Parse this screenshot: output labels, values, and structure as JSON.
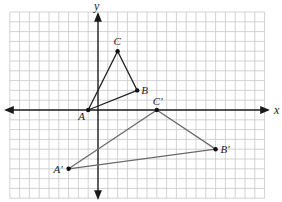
{
  "diagram": {
    "type": "coordinate-plane-transformation",
    "origin_px": [
      98,
      110
    ],
    "unit_px": 9.8,
    "grid": {
      "x_min": -9,
      "x_max": 17,
      "y_min": -9,
      "y_max": 10,
      "color": "#c8c8c8"
    },
    "axes": {
      "x_label": "x",
      "y_label": "y",
      "color": "#1a1a1a"
    },
    "triangle_original": {
      "color": "#222222",
      "points": [
        {
          "label": "A",
          "x": -1,
          "y": 0
        },
        {
          "label": "B",
          "x": 4,
          "y": 2
        },
        {
          "label": "C",
          "x": 2,
          "y": 6
        }
      ]
    },
    "triangle_image": {
      "color": "#6a6a6a",
      "points": [
        {
          "label": "A'",
          "x": -3,
          "y": -6
        },
        {
          "label": "B'",
          "x": 12,
          "y": -4
        },
        {
          "label": "C'",
          "x": 6,
          "y": 0
        }
      ]
    }
  }
}
